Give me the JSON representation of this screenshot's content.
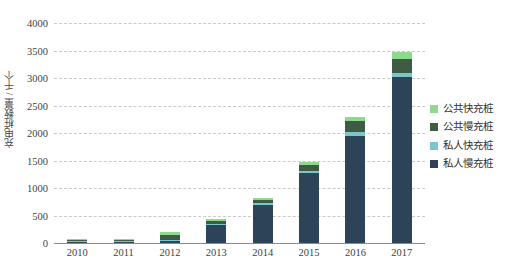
{
  "chart_data": {
    "type": "bar",
    "stacked": true,
    "title": "",
    "xlabel": "",
    "ylabel": "充电桩数量 / 千个",
    "ylim": [
      0,
      4000
    ],
    "ytick_step": 500,
    "yticks": [
      "0",
      "500",
      "1000",
      "1500",
      "2000",
      "2500",
      "3000",
      "3500",
      "4000"
    ],
    "grid": true,
    "legend_position": "right",
    "categories": [
      "2010",
      "2011",
      "2012",
      "2013",
      "2014",
      "2015",
      "2016",
      "2017"
    ],
    "series": [
      {
        "name": "私人慢充桩",
        "color": "#2c4358",
        "values": [
          2,
          10,
          40,
          330,
          700,
          1270,
          1950,
          3010
        ]
      },
      {
        "name": "私人快充桩",
        "color": "#7dc4cc",
        "values": [
          1,
          4,
          12,
          18,
          25,
          45,
          60,
          90
        ]
      },
      {
        "name": "公共慢充桩",
        "color": "#3e5c44",
        "values": [
          9,
          26,
          95,
          55,
          65,
          110,
          200,
          250
        ]
      },
      {
        "name": "公共快充桩",
        "color": "#8ed98e",
        "values": [
          6,
          15,
          43,
          27,
          30,
          55,
          80,
          130
        ]
      }
    ],
    "totals": [
      18,
      55,
      190,
      430,
      820,
      1480,
      2290,
      3480
    ]
  },
  "legend": {
    "items": [
      {
        "label": "公共快充桩",
        "color": "#8ed98e"
      },
      {
        "label": "公共慢充桩",
        "color": "#3e5c44"
      },
      {
        "label": "私人快充桩",
        "color": "#7dc4cc"
      },
      {
        "label": "私人慢充桩",
        "color": "#2c4358"
      }
    ]
  }
}
